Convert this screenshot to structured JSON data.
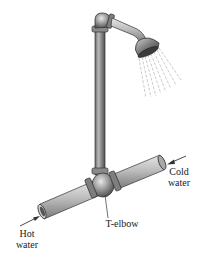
{
  "diagram": {
    "labels": {
      "hot_water_line1": "Hot",
      "hot_water_line2": "water",
      "cold_water_line1": "Cold",
      "cold_water_line2": "water",
      "t_elbow": "T-elbow"
    },
    "colors": {
      "pipe_dark": "#5a5a5a",
      "pipe_mid": "#9a9a9a",
      "pipe_light": "#d8d8d8",
      "outline": "#333333",
      "text": "#1a1a1a",
      "spray": "#aaaaaa"
    }
  }
}
